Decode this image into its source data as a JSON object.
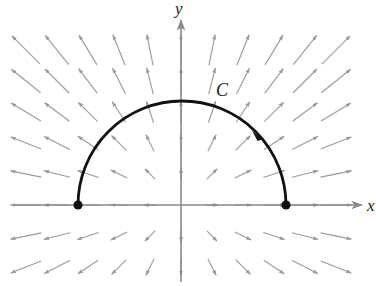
{
  "diagram": {
    "type": "vector_field_with_curve",
    "labels": {
      "x_axis": "x",
      "y_axis": "y",
      "curve": "C"
    },
    "colors": {
      "field_arrow": "#9a9a9a",
      "axis": "#8a8a8a",
      "curve": "#111111",
      "background": "#ffffff"
    },
    "origin_px": [
      181,
      205
    ],
    "grid_spacing_px": [
      31,
      31
    ],
    "grid_x": [
      -5,
      -4,
      -3,
      -2,
      -1,
      0,
      1,
      2,
      3,
      4,
      5
    ],
    "grid_y": [
      -2,
      -1,
      0,
      1,
      2,
      3,
      4,
      5
    ],
    "curve": {
      "shape": "upper semicircle",
      "center": [
        0,
        0
      ],
      "radius_units": 3.4,
      "start_point": [
        3.4,
        0
      ],
      "end_point": [
        -3.4,
        0
      ],
      "orientation": "counterclockwise",
      "endpoints_marked": true
    }
  }
}
